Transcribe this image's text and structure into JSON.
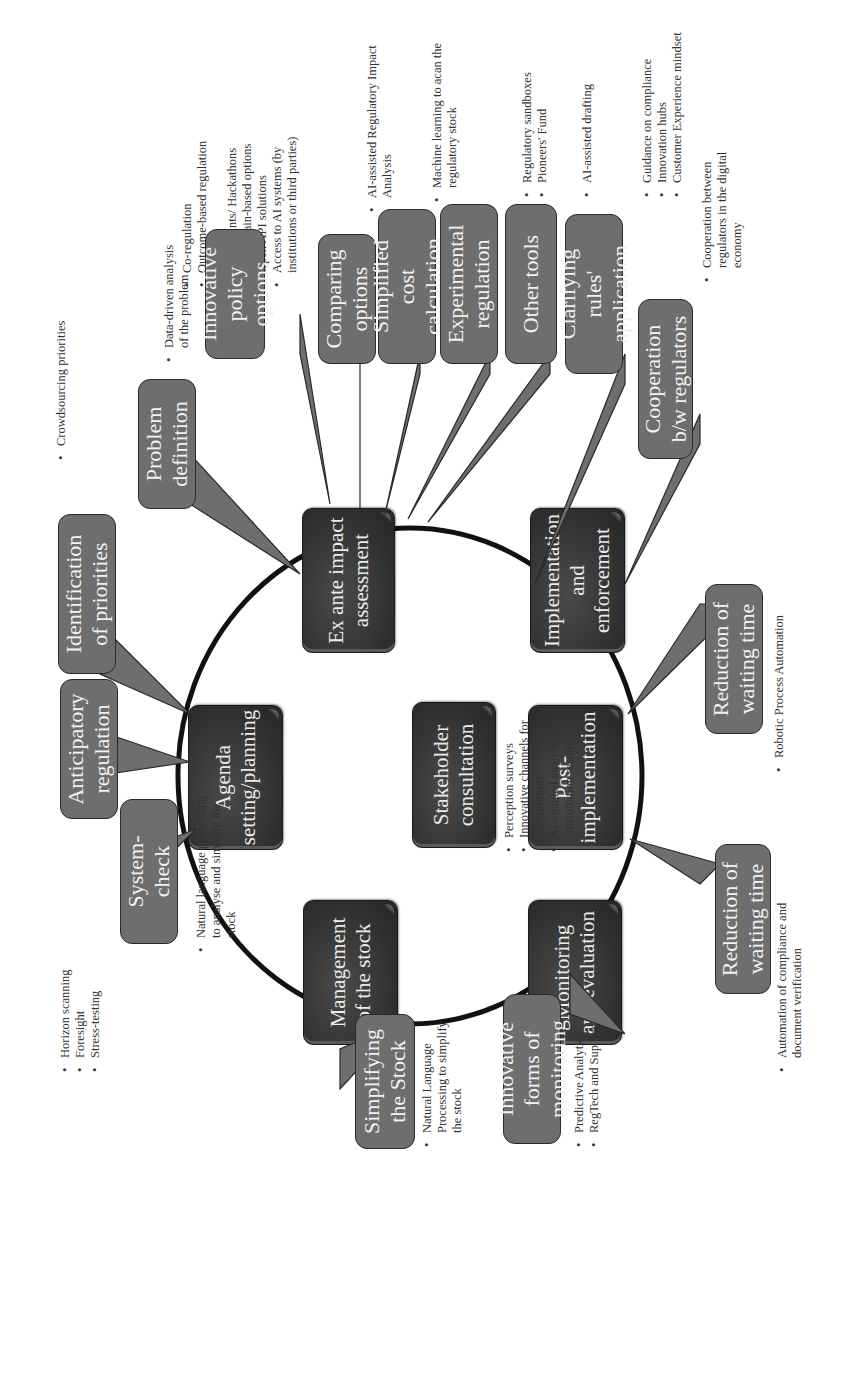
{
  "orientation": "rotated-90-ccw",
  "colors": {
    "main_box": "#2f2f2f",
    "callout": "#6e6e6e",
    "ring": "#111111",
    "text_light": "#eaeaea",
    "text_dark": "#333333"
  },
  "cycle": {
    "agenda": "Agenda setting/planning",
    "ex_ante": "Ex ante impact assessment",
    "implementation": "Implementation and enforcement",
    "post_implementation": "Post-implementation",
    "monitoring": "Monitoring and evaluation",
    "management": "Management of the stock",
    "stakeholder": "Stakeholder consultation"
  },
  "stakeholder_notes": [
    "Perception surveys",
    "Innovative channels for consultation",
    "AI-enabled analysis of consultation results"
  ],
  "callouts": {
    "system_check": {
      "label": "System-check",
      "notes": [
        "Natural language processing to analyse and simplify the stock"
      ]
    },
    "anticipatory": {
      "label": "Anticipatory regulation",
      "notes": [
        "Horizon scanning",
        "Foresight",
        "Stress-testing"
      ]
    },
    "priorities": {
      "label": "Identification of priorities",
      "notes": [
        "Crowdsourcing priorities"
      ]
    },
    "problem": {
      "label": "Problem definition",
      "notes": [
        "Data-driven analysis of the problem"
      ]
    },
    "innovative_policy": {
      "label": "Innovative policy options",
      "notes": [
        "Co-regulation",
        "Outcome-based regulation",
        "RegTech",
        "TechSprints/ Hackathons",
        "Blockchain-based options",
        "Open API solutions",
        "Access to AI systems (by institutions or third parties)"
      ]
    },
    "comparing": {
      "label": "Comparing options",
      "notes": [
        "AI-assisted Regulatory Impact Analysis"
      ]
    },
    "cost": {
      "label": "Simplified cost calculation",
      "notes": [
        "Machine learning to acan the regulatory stock"
      ]
    },
    "experimental": {
      "label": "Experimental regulation",
      "notes": [
        "Regulatory sandboxes",
        "Pioneers' Fund"
      ]
    },
    "other_tools": {
      "label": "Other tools",
      "notes": [
        "AI-assisted drafting"
      ]
    },
    "clarifying": {
      "label": "Clarifying rules' application",
      "notes": [
        "Guidance on compliance",
        "Innovation hubs",
        "Customer Experience mindset"
      ]
    },
    "cooperation": {
      "label": "Cooperation b/w regulators",
      "notes": [
        "Cooperation between regulators in the digital economy"
      ]
    },
    "waiting_impl": {
      "label": "Reduction of waiting time",
      "notes": [
        "Robotic Process Automation"
      ]
    },
    "waiting_post": {
      "label": "Reduction of waiting time",
      "notes": [
        "Automation of compliance and document verification"
      ]
    },
    "innovative_monitoring": {
      "label": "Innovative forms of monitoring",
      "notes": [
        "Predictive Analytics",
        "RegTech and Sup Tech"
      ]
    },
    "simplifying_stock": {
      "label": "Simplifying the Stock",
      "notes": [
        "Natural Language Processing to simplify the stock"
      ]
    }
  }
}
